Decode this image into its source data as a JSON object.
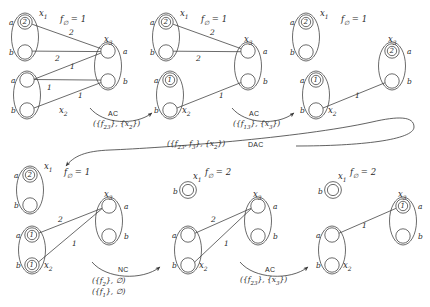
{
  "diagram": {
    "colors": {
      "stroke": "#3a3a3a",
      "text": "#2a2a2a",
      "background": "#ffffff"
    },
    "value_labels": {
      "a": "a",
      "b": "b"
    },
    "panels": [
      {
        "id": "p1",
        "cost_label": "f",
        "cost_sub": "∅",
        "cost_eq": "= 1",
        "variables": [
          {
            "name": "x",
            "sub": "1",
            "values": [
              {
                "label": "a",
                "cost": "2"
              },
              {
                "label": "b",
                "cost": ""
              }
            ]
          },
          {
            "name": "x",
            "sub": "2",
            "values": [
              {
                "label": "a",
                "cost": ""
              },
              {
                "label": "b",
                "cost": ""
              }
            ]
          },
          {
            "name": "x",
            "sub": "3",
            "values": [
              {
                "label": "a",
                "cost": ""
              },
              {
                "label": "b",
                "cost": ""
              }
            ]
          }
        ],
        "edges": [
          {
            "from": "x1a",
            "to": "x3a",
            "weight": "2"
          },
          {
            "from": "x1b",
            "to": "x3a",
            "weight": "2"
          },
          {
            "from": "x2a",
            "to": "x3a",
            "weight": "1"
          },
          {
            "from": "x2a",
            "to": "x3b",
            "weight": "1"
          },
          {
            "from": "x2b",
            "to": "x3b",
            "weight": "1"
          }
        ]
      },
      {
        "id": "p2",
        "cost_label": "f",
        "cost_sub": "∅",
        "cost_eq": "= 1",
        "variables": [
          {
            "name": "x",
            "sub": "1",
            "values": [
              {
                "label": "a",
                "cost": "2"
              },
              {
                "label": "b",
                "cost": ""
              }
            ]
          },
          {
            "name": "x",
            "sub": "2",
            "values": [
              {
                "label": "a",
                "cost": "1"
              },
              {
                "label": "b",
                "cost": ""
              }
            ]
          },
          {
            "name": "x",
            "sub": "3",
            "values": [
              {
                "label": "a",
                "cost": ""
              },
              {
                "label": "b",
                "cost": ""
              }
            ]
          }
        ],
        "edges": [
          {
            "from": "x1a",
            "to": "x3a",
            "weight": "2"
          },
          {
            "from": "x1b",
            "to": "x3a",
            "weight": "2"
          },
          {
            "from": "x2b",
            "to": "x3b",
            "weight": "1"
          }
        ]
      },
      {
        "id": "p3",
        "cost_label": "f",
        "cost_sub": "∅",
        "cost_eq": "= 1",
        "variables": [
          {
            "name": "x",
            "sub": "1",
            "values": [
              {
                "label": "a",
                "cost": "2"
              },
              {
                "label": "b",
                "cost": ""
              }
            ]
          },
          {
            "name": "x",
            "sub": "2",
            "values": [
              {
                "label": "a",
                "cost": "1"
              },
              {
                "label": "b",
                "cost": ""
              }
            ]
          },
          {
            "name": "x",
            "sub": "3",
            "values": [
              {
                "label": "a",
                "cost": "2"
              },
              {
                "label": "b",
                "cost": ""
              }
            ]
          }
        ],
        "edges": [
          {
            "from": "x2b",
            "to": "x3b",
            "weight": "1"
          }
        ]
      },
      {
        "id": "p4",
        "cost_label": "f",
        "cost_sub": "∅",
        "cost_eq": "= 1",
        "variables": [
          {
            "name": "x",
            "sub": "1",
            "values": [
              {
                "label": "a",
                "cost": "2"
              },
              {
                "label": "b",
                "cost": ""
              }
            ]
          },
          {
            "name": "x",
            "sub": "2",
            "values": [
              {
                "label": "a",
                "cost": "1"
              },
              {
                "label": "b",
                "cost": "1"
              }
            ]
          },
          {
            "name": "x",
            "sub": "3",
            "values": [
              {
                "label": "a",
                "cost": ""
              },
              {
                "label": "b",
                "cost": ""
              }
            ]
          }
        ],
        "edges": [
          {
            "from": "x2a",
            "to": "x3a",
            "weight": "2"
          },
          {
            "from": "x2b",
            "to": "x3a",
            "weight": "1"
          }
        ]
      },
      {
        "id": "p5",
        "cost_label": "f",
        "cost_sub": "∅",
        "cost_eq": "= 2",
        "variables": [
          {
            "name": "x",
            "sub": "1",
            "values": [
              {
                "label": "b",
                "cost": ""
              }
            ]
          },
          {
            "name": "x",
            "sub": "2",
            "values": [
              {
                "label": "a",
                "cost": ""
              },
              {
                "label": "b",
                "cost": ""
              }
            ]
          },
          {
            "name": "x",
            "sub": "3",
            "values": [
              {
                "label": "a",
                "cost": ""
              },
              {
                "label": "b",
                "cost": ""
              }
            ]
          }
        ],
        "edges": [
          {
            "from": "x2a",
            "to": "x3a",
            "weight": "2"
          },
          {
            "from": "x2b",
            "to": "x3a",
            "weight": "1"
          }
        ]
      },
      {
        "id": "p6",
        "cost_label": "f",
        "cost_sub": "∅",
        "cost_eq": "= 2",
        "variables": [
          {
            "name": "x",
            "sub": "1",
            "values": [
              {
                "label": "b",
                "cost": ""
              }
            ]
          },
          {
            "name": "x",
            "sub": "2",
            "values": [
              {
                "label": "a",
                "cost": ""
              },
              {
                "label": "b",
                "cost": ""
              }
            ]
          },
          {
            "name": "x",
            "sub": "3",
            "values": [
              {
                "label": "a",
                "cost": "1"
              },
              {
                "label": "b",
                "cost": ""
              }
            ]
          }
        ],
        "edges": [
          {
            "from": "x2a",
            "to": "x3a",
            "weight": "1"
          }
        ]
      }
    ],
    "transitions": [
      {
        "id": "t1",
        "op": "AC",
        "args": [
          "({f23}, {x2})"
        ],
        "args_html": "({<i>f</i><sub>23</sub>}, {<i>x</i><sub>2</sub>})",
        "from_panel": "p1",
        "to_panel": "p2"
      },
      {
        "id": "t2",
        "op": "AC",
        "args": [
          "({f13}, {x3})"
        ],
        "args_html": "({<i>f</i><sub>13</sub>}, {<i>x</i><sub>3</sub>})",
        "from_panel": "p2",
        "to_panel": "p3"
      },
      {
        "id": "t3",
        "op": "DAC",
        "args": [
          "({f23, f3}, {x2})"
        ],
        "args_html": "({<i>f</i><sub>23</sub>, <i>f</i><sub>3</sub>}, {<i>x</i><sub>2</sub>})",
        "from_panel": "p3",
        "to_panel": "p4"
      },
      {
        "id": "t4",
        "op": "NC",
        "args": [
          "({f2}, ∅)",
          "({f1}, ∅)"
        ],
        "args_html": "({<i>f</i><sub>2</sub>}, ∅)<br>({<i>f</i><sub>1</sub>}, ∅)",
        "from_panel": "p4",
        "to_panel": "p5"
      },
      {
        "id": "t5",
        "op": "AC",
        "args": [
          "({f23}, {x3})"
        ],
        "args_html": "({<i>f</i><sub>23</sub>}, {<i>x</i><sub>3</sub>})",
        "from_panel": "p5",
        "to_panel": "p6"
      }
    ]
  }
}
